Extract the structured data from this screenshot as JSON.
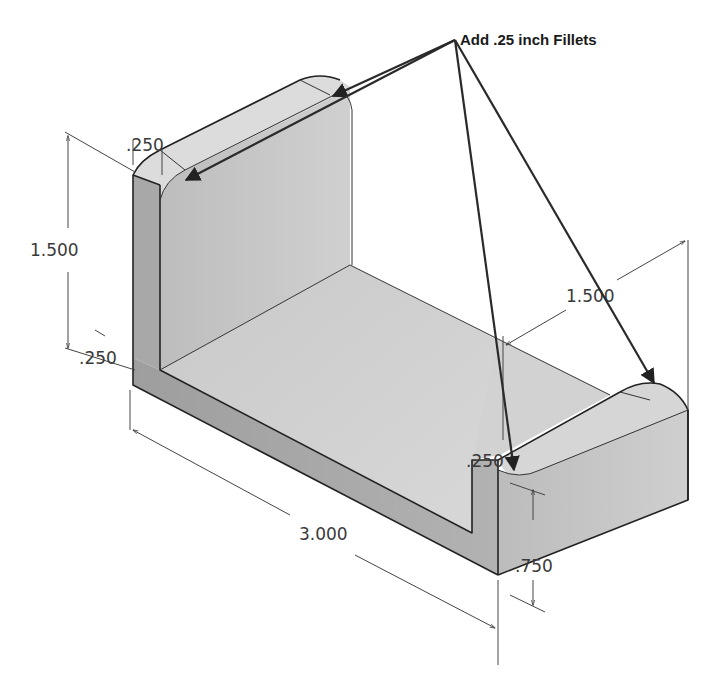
{
  "figure": {
    "type": "isometric-part-drawing",
    "annotation": {
      "text": "Add .25 inch Fillets",
      "leader_count": 4
    },
    "dimensions": [
      {
        "id": "upright-height",
        "label": "1.500"
      },
      {
        "id": "upright-thickness-top",
        "label": ".250"
      },
      {
        "id": "base-thickness-left",
        "label": ".250"
      },
      {
        "id": "depth",
        "label": "1.500"
      },
      {
        "id": "length",
        "label": "3.000"
      },
      {
        "id": "right-block-thickness",
        "label": ".250"
      },
      {
        "id": "right-block-height",
        "label": ".750"
      }
    ],
    "colors": {
      "background": "#ffffff",
      "face_light": "#d9d9d9",
      "face_mid": "#c4c4c4",
      "face_dark": "#a9a9a9",
      "edge": "#222222"
    }
  }
}
